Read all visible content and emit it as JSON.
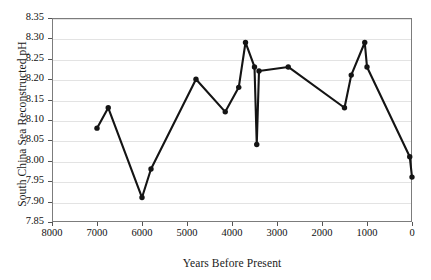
{
  "chart_data": {
    "type": "line",
    "title": "",
    "xlabel": "Years Before Present",
    "ylabel": "South China Sea Reconstructed pH",
    "xlim": [
      8000,
      0
    ],
    "ylim": [
      7.85,
      8.35
    ],
    "x_reversed": true,
    "grid": "horizontal",
    "legend": "none",
    "marker": "filled-circle",
    "line_color": "#141414",
    "grid_color": "#e3e3e3",
    "frame_color": "#7c7c7c",
    "xticks": [
      8000,
      7000,
      6000,
      5000,
      4000,
      3000,
      2000,
      1000,
      0
    ],
    "xtick_labels": [
      "8000",
      "7000",
      "6000",
      "5000",
      "4000",
      "3000",
      "2000",
      "1000",
      "0"
    ],
    "yticks": [
      7.85,
      7.9,
      7.95,
      8.0,
      8.05,
      8.1,
      8.15,
      8.2,
      8.25,
      8.3,
      8.35
    ],
    "ytick_labels": [
      "7.85",
      "7.90",
      "7.95",
      "8.00",
      "8.05",
      "8.10",
      "8.15",
      "8.20",
      "8.25",
      "8.30",
      "8.35"
    ],
    "series": [
      {
        "name": "South China Sea Reconstructed pH",
        "x": [
          7000,
          6750,
          6000,
          5800,
          4800,
          4150,
          3850,
          3700,
          3500,
          3450,
          3400,
          2750,
          1500,
          1350,
          1050,
          1000,
          50,
          0
        ],
        "y": [
          8.08,
          8.13,
          7.91,
          7.98,
          8.2,
          8.12,
          8.18,
          8.29,
          8.23,
          8.04,
          8.22,
          8.23,
          8.13,
          8.21,
          8.29,
          8.23,
          8.01,
          7.96
        ]
      }
    ]
  },
  "axes": {
    "y_title": "South China Sea Reconstructed pH",
    "x_title": "Years Before Present"
  }
}
